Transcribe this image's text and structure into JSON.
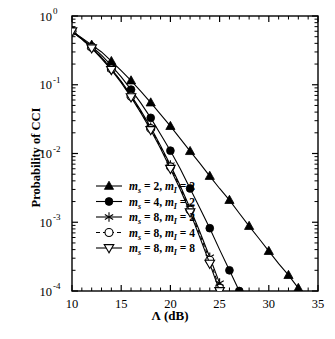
{
  "chart_data": {
    "type": "line",
    "title": "",
    "xlabel": "Λ (dB)",
    "ylabel": "Probability of CCI",
    "xlim": [
      10,
      35
    ],
    "ylim": [
      0.0001,
      1
    ],
    "yscale": "log",
    "xticks": [
      10,
      15,
      20,
      25,
      30,
      35
    ],
    "xticklabels": [
      "10",
      "15",
      "20",
      "25",
      "30",
      "35"
    ],
    "yticks": [
      0.0001,
      0.001,
      0.01,
      0.1,
      1
    ],
    "yticklabels": [
      "10",
      "10",
      "10",
      "10",
      "10"
    ],
    "yticksuperscripts": [
      "-4",
      "-3",
      "-2",
      "-1",
      "0"
    ],
    "grid": false,
    "legend_position": "lower-left-inside",
    "series": [
      {
        "name": "m_s = 2, m_I = 2",
        "marker": "filled-triangle-up",
        "linestyle": "solid",
        "x": [
          10,
          11,
          12,
          13,
          14,
          15,
          16,
          17,
          18,
          19,
          20,
          21,
          22,
          23,
          24,
          25,
          26,
          27,
          28,
          29,
          30,
          31,
          32,
          33
        ],
        "y": [
          0.6,
          0.48,
          0.38,
          0.3,
          0.22,
          0.16,
          0.115,
          0.08,
          0.055,
          0.037,
          0.025,
          0.0165,
          0.0108,
          0.0072,
          0.0047,
          0.0031,
          0.0021,
          0.00135,
          0.00088,
          0.00058,
          0.00038,
          0.00025,
          0.00017,
          0.00011
        ]
      },
      {
        "name": "m_s = 4, m_I = 2",
        "marker": "filled-circle",
        "linestyle": "solid",
        "x": [
          10,
          11,
          12,
          13,
          14,
          15,
          16,
          17,
          18,
          19,
          20,
          21,
          22,
          23,
          24,
          25,
          26,
          27,
          28,
          29,
          30,
          31
        ],
        "y": [
          0.6,
          0.47,
          0.36,
          0.27,
          0.19,
          0.13,
          0.085,
          0.054,
          0.033,
          0.019,
          0.011,
          0.006,
          0.0031,
          0.0016,
          0.00082,
          0.0004,
          0.0002,
          0.0001,
          5e-05,
          2.5e-05,
          1.3e-05,
          1e-05
        ]
      },
      {
        "name": "m_s = 8, m_I = 2",
        "marker": "asterisk",
        "linestyle": "solid",
        "x": [
          10,
          11,
          12,
          13,
          14,
          15,
          16,
          17,
          18,
          19,
          20,
          21,
          22,
          23,
          24,
          25,
          26,
          27,
          28,
          29,
          30
        ],
        "y": [
          0.6,
          0.46,
          0.35,
          0.25,
          0.17,
          0.112,
          0.07,
          0.042,
          0.024,
          0.013,
          0.0068,
          0.0034,
          0.0016,
          0.00072,
          0.00031,
          0.00013,
          5e-05,
          2e-05,
          8e-06,
          3e-06,
          1e-06
        ]
      },
      {
        "name": "m_s = 8, m_I = 4",
        "marker": "open-circle",
        "linestyle": "dashed",
        "x": [
          10,
          11,
          12,
          13,
          14,
          15,
          16,
          17,
          18,
          19,
          20,
          21,
          22,
          23,
          24,
          25,
          26,
          27,
          28,
          29,
          30
        ],
        "y": [
          0.6,
          0.46,
          0.35,
          0.25,
          0.17,
          0.11,
          0.068,
          0.04,
          0.023,
          0.0125,
          0.0064,
          0.0032,
          0.0015,
          0.00066,
          0.00028,
          0.00011,
          4.3e-05,
          1.6e-05,
          6e-06,
          2.2e-06,
          8e-07
        ]
      },
      {
        "name": "m_s = 8, m_I = 8",
        "marker": "open-triangle-down",
        "linestyle": "solid",
        "x": [
          10,
          11,
          12,
          13,
          14,
          15,
          16,
          17,
          18,
          19,
          20,
          21,
          22,
          23,
          24,
          25,
          26,
          27,
          28,
          29,
          30
        ],
        "y": [
          0.6,
          0.46,
          0.34,
          0.24,
          0.165,
          0.107,
          0.066,
          0.039,
          0.022,
          0.0118,
          0.006,
          0.003,
          0.0014,
          0.0006,
          0.00025,
          0.0001,
          4e-05,
          1.5e-05,
          5.5e-06,
          2e-06,
          7e-07
        ]
      }
    ],
    "legend_entries": [
      {
        "marker": "filled-triangle-up",
        "line": "solid",
        "ms": "2",
        "mi": "2"
      },
      {
        "marker": "filled-circle",
        "line": "solid",
        "ms": "4",
        "mi": "2"
      },
      {
        "marker": "asterisk",
        "line": "solid",
        "ms": "8",
        "mi": "2"
      },
      {
        "marker": "open-circle",
        "line": "dashed",
        "ms": "8",
        "mi": "4"
      },
      {
        "marker": "open-triangle-down",
        "line": "solid",
        "ms": "8",
        "mi": "8"
      }
    ],
    "legend_symbol_ms": "m",
    "legend_sub_s": "s",
    "legend_symbol_mi": "m",
    "legend_sub_i": "I",
    "colors": {
      "axis": "#000000",
      "series": "#000000",
      "background": "#ffffff"
    }
  }
}
